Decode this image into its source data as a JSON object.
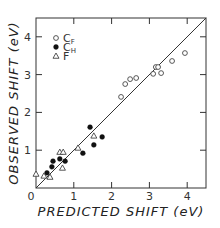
{
  "chart_data": {
    "type": "scatter",
    "title": "",
    "xlabel": "PREDICTED SHIFT (eV)",
    "ylabel": "OBSERVED SHIFT (eV)",
    "xlim": [
      0,
      4.5
    ],
    "ylim": [
      0,
      4.5
    ],
    "xticks": [
      0,
      1,
      2,
      3,
      4
    ],
    "yticks": [
      0,
      1,
      2,
      3,
      4
    ],
    "xtick_labels": [
      "0",
      "1",
      "2",
      "3",
      "4"
    ],
    "ytick_labels": [
      "",
      "1",
      "2",
      "3",
      "4"
    ],
    "origin_label": "0",
    "grid": false,
    "legend_position": "upper-left",
    "reference_line": {
      "type": "y=x",
      "from": [
        0,
        0
      ],
      "to": [
        4.5,
        4.5
      ]
    },
    "series": [
      {
        "name": "CF",
        "label_main": "C",
        "label_sub": "F",
        "marker": "open-circle",
        "points": [
          [
            2.25,
            2.41
          ],
          [
            2.36,
            2.75
          ],
          [
            2.49,
            2.88
          ],
          [
            2.65,
            2.91
          ],
          [
            3.1,
            3.02
          ],
          [
            3.17,
            3.2
          ],
          [
            3.23,
            3.2
          ],
          [
            3.31,
            3.04
          ],
          [
            3.6,
            3.36
          ],
          [
            3.94,
            3.57
          ]
        ]
      },
      {
        "name": "CH",
        "label_main": "C",
        "label_sub": "H",
        "marker": "filled-circle",
        "points": [
          [
            0.29,
            0.4
          ],
          [
            0.42,
            0.56
          ],
          [
            0.45,
            0.71
          ],
          [
            0.63,
            0.77
          ],
          [
            0.77,
            0.71
          ],
          [
            1.24,
            0.92
          ],
          [
            1.43,
            1.61
          ],
          [
            1.53,
            1.14
          ],
          [
            1.75,
            1.35
          ]
        ]
      },
      {
        "name": "F",
        "label_main": "F",
        "label_sub": "",
        "marker": "open-triangle",
        "points": [
          [
            0.0,
            0.37
          ],
          [
            0.21,
            0.32
          ],
          [
            0.37,
            0.29
          ],
          [
            0.63,
            0.95
          ],
          [
            0.72,
            0.95
          ],
          [
            0.7,
            0.53
          ],
          [
            1.11,
            1.06
          ],
          [
            1.53,
            1.38
          ]
        ]
      }
    ]
  },
  "layout": {
    "plot_left": 36,
    "plot_bottom": 188,
    "plot_right": 206,
    "plot_top": 18,
    "px_per_unit": 37.8
  }
}
